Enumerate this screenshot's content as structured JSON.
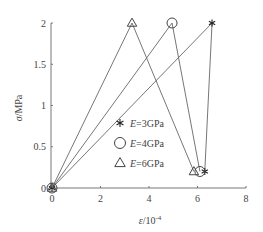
{
  "chart_data": {
    "type": "line",
    "title": "",
    "xlabel": "ε/10⁻⁴",
    "ylabel": "σ/MPa",
    "xlim": [
      0,
      8
    ],
    "ylim": [
      0,
      2
    ],
    "xticks": [
      "0",
      "2",
      "4",
      "6",
      "8"
    ],
    "yticks": [
      "0",
      "0.5",
      "1",
      "1.5",
      "2"
    ],
    "grid": false,
    "legend_position": "lower-center-left",
    "series": [
      {
        "name": "E=3GPa",
        "marker": "asterisk",
        "x": [
          0,
          6.6,
          6.3
        ],
        "y": [
          0,
          2,
          0.2
        ]
      },
      {
        "name": "E=4GPa",
        "marker": "circle",
        "x": [
          0,
          4.95,
          6.1
        ],
        "y": [
          0,
          2,
          0.2
        ]
      },
      {
        "name": "E=6GPa",
        "marker": "triangle",
        "x": [
          0,
          3.3,
          5.85
        ],
        "y": [
          0,
          2,
          0.2
        ]
      }
    ]
  },
  "axes": {
    "x_label_var": "ε",
    "x_label_unit": "/10",
    "x_label_exp": "-4",
    "y_label_var": "σ",
    "y_label_unit": "/MPa"
  },
  "legend": [
    {
      "var": "E",
      "text": "=3GPa",
      "marker": "asterisk"
    },
    {
      "var": "E",
      "text": "=4GPa",
      "marker": "circle"
    },
    {
      "var": "E",
      "text": "=6GPa",
      "marker": "triangle"
    }
  ]
}
